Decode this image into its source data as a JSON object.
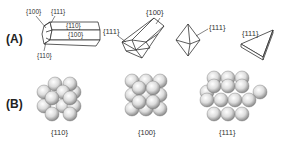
{
  "panels": {
    "a": {
      "label": "(A)",
      "rod": {
        "labels": [
          "{100}",
          "{111}",
          "{110}",
          "{100}",
          "{110}"
        ]
      },
      "bipyramid": {
        "labels": [
          "{111}",
          "{100}"
        ]
      },
      "octahedron": {
        "labels": [
          "{111}"
        ]
      },
      "plate": {
        "labels": [
          "{111}"
        ]
      }
    },
    "b": {
      "label": "(B)",
      "facets": [
        {
          "name": "110",
          "label": "{110}"
        },
        {
          "name": "100",
          "label": "{100}"
        },
        {
          "name": "111",
          "label": "{111}"
        }
      ]
    }
  },
  "colors": {
    "line": "#333333",
    "sphere_light": "#f4f4f4",
    "sphere_dark": "#8a8a8a",
    "background": "#ffffff"
  }
}
